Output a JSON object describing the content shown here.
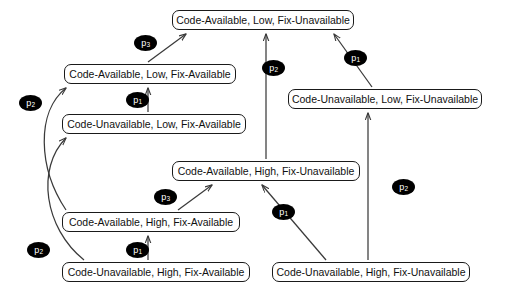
{
  "diagram": {
    "type": "state-transition-lattice",
    "background_color": "#ffffff",
    "node_border_color": "#1a1a1a",
    "node_fill_color": "#ffffff",
    "edge_color": "#3a3a3a",
    "label_fill_color": "#000000",
    "label_text_color": "#ffffff",
    "nodes": [
      {
        "id": "n1",
        "label": "Code-Available, Low, Fix-Unavailable",
        "x": 172,
        "y": 10,
        "width": 182
      },
      {
        "id": "n2",
        "label": "Code-Available, Low, Fix-Available",
        "x": 64,
        "y": 64,
        "width": 172
      },
      {
        "id": "n3",
        "label": "Code-Unavailable, Low, Fix-Unavailable",
        "x": 288,
        "y": 89,
        "width": 194
      },
      {
        "id": "n4",
        "label": "Code-Unavailable, Low, Fix-Available",
        "x": 62,
        "y": 114,
        "width": 184
      },
      {
        "id": "n5",
        "label": "Code-Available, High, Fix-Unavailable",
        "x": 172,
        "y": 161,
        "width": 188
      },
      {
        "id": "n6",
        "label": "Code-Available, High, Fix-Available",
        "x": 62,
        "y": 212,
        "width": 178
      },
      {
        "id": "n7",
        "label": "Code-Unavailable, High, Fix-Available",
        "x": 62,
        "y": 262,
        "width": 188
      },
      {
        "id": "n8",
        "label": "Code-Unavailable, High, Fix-Unavailable",
        "x": 272,
        "y": 262,
        "width": 198
      }
    ],
    "edges": [
      {
        "id": "e1",
        "from": "n2",
        "to": "n1",
        "label": "p",
        "sub": "3",
        "label_x": 134,
        "label_y": 35
      },
      {
        "id": "e2",
        "from": "n3",
        "to": "n1",
        "label": "p",
        "sub": "1",
        "label_x": 344,
        "label_y": 50
      },
      {
        "id": "e3",
        "from": "n5",
        "to": "n1",
        "label": "p",
        "sub": "2",
        "label_x": 262,
        "label_y": 60
      },
      {
        "id": "e4",
        "from": "n4",
        "to": "n2",
        "label": "p",
        "sub": "1",
        "label_x": 126,
        "label_y": 92
      },
      {
        "id": "e5",
        "from": "n6",
        "to": "n2",
        "label": "p",
        "sub": "2",
        "label_x": 19,
        "label_y": 95
      },
      {
        "id": "e6",
        "from": "n8",
        "to": "n3",
        "label": "p",
        "sub": "2",
        "label_x": 392,
        "label_y": 179
      },
      {
        "id": "e7",
        "from": "n6",
        "to": "n5",
        "label": "p",
        "sub": "3",
        "label_x": 154,
        "label_y": 189
      },
      {
        "id": "e8",
        "from": "n8",
        "to": "n5",
        "label": "p",
        "sub": "1",
        "label_x": 272,
        "label_y": 204
      },
      {
        "id": "e9",
        "from": "n7",
        "to": "n6",
        "label": "p",
        "sub": "1",
        "label_x": 126,
        "label_y": 242
      },
      {
        "id": "e10",
        "from": "n7",
        "to": "n4",
        "label": "p",
        "sub": "2",
        "label_x": 27,
        "label_y": 242
      }
    ]
  }
}
